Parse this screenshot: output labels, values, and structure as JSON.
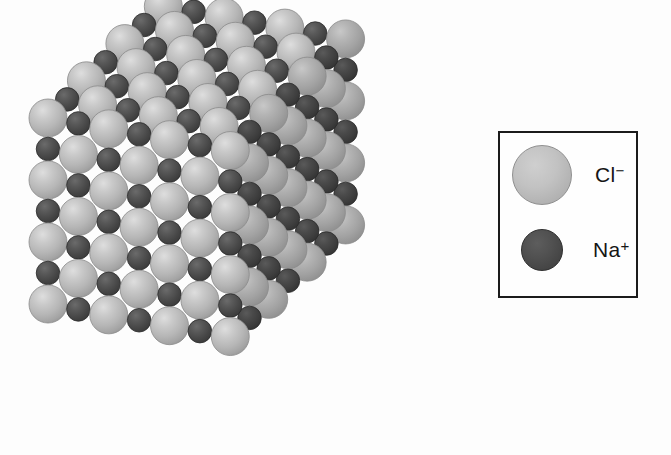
{
  "figure": {
    "name": "sodium-chloride-crystal-lattice",
    "background_color": "#fdfdfd",
    "projection": "corner-view isometric cube showing top, front-left and right faces",
    "grid": {
      "columns": 7,
      "rows": 7,
      "layers": 7
    },
    "ions": [
      {
        "symbol": "Cl",
        "charge": "-",
        "label": "Cl⁻",
        "color": "#b8b8b8",
        "highlight_color": "#cfcfcf",
        "shadow_color": "#a2a2a2",
        "relative_radius": 1.0,
        "role": "anion"
      },
      {
        "symbol": "Na",
        "charge": "+",
        "label": "Na⁺",
        "color": "#4a4a4a",
        "highlight_color": "#5d5d5d",
        "shadow_color": "#3a3a3a",
        "relative_radius": 0.62,
        "role": "cation"
      }
    ]
  },
  "legend": {
    "border_color": "#1b1b1b",
    "background_color": "#fefefe",
    "entries": [
      {
        "swatch_name": "chloride-ion-swatch",
        "label_base": "Cl",
        "label_charge": "−",
        "color": "#b8b8b8",
        "diameter_px": 60
      },
      {
        "swatch_name": "sodium-ion-swatch",
        "label_base": "Na",
        "label_charge": "+",
        "color": "#4a4a4a",
        "diameter_px": 42
      }
    ]
  },
  "chart_data": {
    "type": "diagram",
    "categories": [
      "Cl⁻",
      "Na⁺"
    ],
    "values": [
      1.0,
      0.62
    ],
    "legend_entries": [
      "Cl⁻",
      "Na⁺"
    ],
    "annotations": [],
    "xlabel": "",
    "ylabel": ""
  }
}
